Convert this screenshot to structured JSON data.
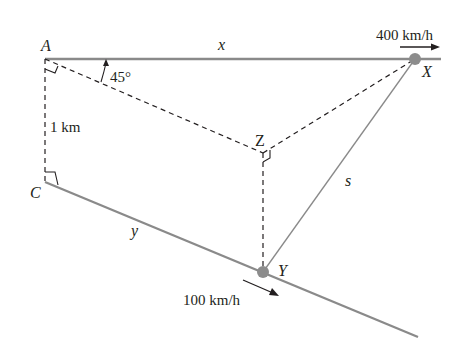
{
  "figure": {
    "points": {
      "A": "A",
      "C": "C",
      "X": "X",
      "Y": "Y",
      "Z": "Z"
    },
    "segments": {
      "x": "x",
      "y": "y",
      "s": "s"
    },
    "angle_label": "45°",
    "distance_label": "1 km",
    "speed_X": "400 km/h",
    "speed_Y": "100 km/h",
    "colors": {
      "road": "#8a8a8a",
      "dashed": "#231f20",
      "dot": "#8c8c8c",
      "text": "#231f20"
    }
  }
}
